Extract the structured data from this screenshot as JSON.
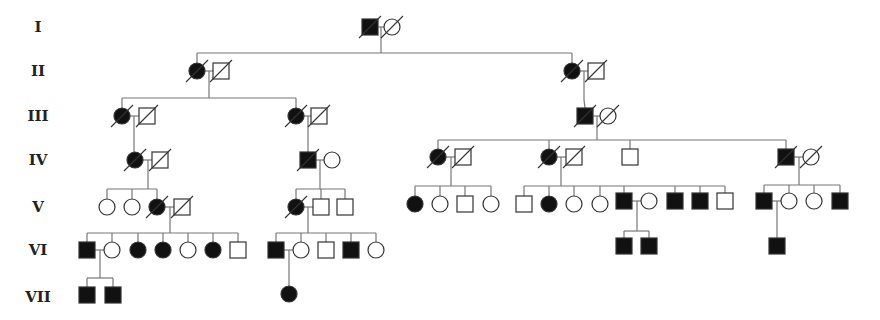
{
  "legend": {
    "affected_fill": "#111111",
    "unaffected_fill": "#ffffff",
    "line_color": "#777777"
  },
  "generations": [
    {
      "label": "I",
      "y": 27
    },
    {
      "label": "II",
      "y": 71
    },
    {
      "label": "III",
      "y": 116
    },
    {
      "label": "IV",
      "y": 160
    },
    {
      "label": "V",
      "y": 207
    },
    {
      "label": "VI",
      "y": 250
    },
    {
      "label": "VII",
      "y": 297
    }
  ],
  "individuals": [
    {
      "id": "I-1",
      "sex": "M",
      "x": 370,
      "y": 27,
      "affected": true,
      "deceased": true
    },
    {
      "id": "I-2",
      "sex": "F",
      "x": 392,
      "y": 27,
      "affected": false,
      "deceased": true
    },
    {
      "id": "II-1",
      "sex": "F",
      "x": 197,
      "y": 71,
      "affected": true,
      "deceased": true
    },
    {
      "id": "II-2",
      "sex": "M",
      "x": 221,
      "y": 71,
      "affected": false,
      "deceased": true
    },
    {
      "id": "II-3",
      "sex": "F",
      "x": 572,
      "y": 71,
      "affected": true,
      "deceased": true
    },
    {
      "id": "II-4",
      "sex": "M",
      "x": 596,
      "y": 71,
      "affected": false,
      "deceased": true
    },
    {
      "id": "III-1",
      "sex": "F",
      "x": 122,
      "y": 116,
      "affected": true,
      "deceased": true
    },
    {
      "id": "III-2",
      "sex": "M",
      "x": 147,
      "y": 116,
      "affected": false,
      "deceased": true
    },
    {
      "id": "III-3",
      "sex": "F",
      "x": 296,
      "y": 116,
      "affected": true,
      "deceased": true
    },
    {
      "id": "III-4",
      "sex": "M",
      "x": 319,
      "y": 116,
      "affected": false,
      "deceased": true
    },
    {
      "id": "III-5",
      "sex": "M",
      "x": 585,
      "y": 116,
      "affected": true,
      "deceased": true
    },
    {
      "id": "III-6",
      "sex": "F",
      "x": 608,
      "y": 116,
      "affected": false,
      "deceased": true
    },
    {
      "id": "IV-1",
      "sex": "F",
      "x": 135,
      "y": 160,
      "affected": true,
      "deceased": true
    },
    {
      "id": "IV-2",
      "sex": "M",
      "x": 160,
      "y": 160,
      "affected": false,
      "deceased": true
    },
    {
      "id": "IV-3",
      "sex": "M",
      "x": 308,
      "y": 160,
      "affected": true,
      "deceased": true
    },
    {
      "id": "IV-4",
      "sex": "F",
      "x": 332,
      "y": 160,
      "affected": false,
      "deceased": false
    },
    {
      "id": "IV-5",
      "sex": "F",
      "x": 438,
      "y": 157,
      "affected": true,
      "deceased": true
    },
    {
      "id": "IV-6",
      "sex": "M",
      "x": 463,
      "y": 157,
      "affected": false,
      "deceased": true
    },
    {
      "id": "IV-7",
      "sex": "F",
      "x": 549,
      "y": 157,
      "affected": true,
      "deceased": true
    },
    {
      "id": "IV-8",
      "sex": "M",
      "x": 574,
      "y": 157,
      "affected": false,
      "deceased": true
    },
    {
      "id": "IV-9",
      "sex": "M",
      "x": 630,
      "y": 157,
      "affected": false,
      "deceased": false
    },
    {
      "id": "IV-10",
      "sex": "M",
      "x": 786,
      "y": 157,
      "affected": true,
      "deceased": true
    },
    {
      "id": "IV-11",
      "sex": "F",
      "x": 811,
      "y": 157,
      "affected": false,
      "deceased": true
    },
    {
      "id": "V-1",
      "sex": "F",
      "x": 107,
      "y": 207,
      "affected": false,
      "deceased": false
    },
    {
      "id": "V-2",
      "sex": "F",
      "x": 132,
      "y": 207,
      "affected": false,
      "deceased": false
    },
    {
      "id": "V-3",
      "sex": "F",
      "x": 157,
      "y": 207,
      "affected": true,
      "deceased": true
    },
    {
      "id": "V-4",
      "sex": "M",
      "x": 182,
      "y": 207,
      "affected": false,
      "deceased": true
    },
    {
      "id": "V-5",
      "sex": "F",
      "x": 296,
      "y": 207,
      "affected": true,
      "deceased": true
    },
    {
      "id": "V-6",
      "sex": "M",
      "x": 321,
      "y": 207,
      "affected": false,
      "deceased": false
    },
    {
      "id": "V-7",
      "sex": "M",
      "x": 345,
      "y": 207,
      "affected": false,
      "deceased": false
    },
    {
      "id": "V-8",
      "sex": "F",
      "x": 415,
      "y": 204,
      "affected": true,
      "deceased": false
    },
    {
      "id": "V-9",
      "sex": "F",
      "x": 440,
      "y": 204,
      "affected": false,
      "deceased": false
    },
    {
      "id": "V-10",
      "sex": "M",
      "x": 465,
      "y": 204,
      "affected": false,
      "deceased": false
    },
    {
      "id": "V-11",
      "sex": "F",
      "x": 491,
      "y": 204,
      "affected": false,
      "deceased": false
    },
    {
      "id": "V-12",
      "sex": "M",
      "x": 524,
      "y": 204,
      "affected": false,
      "deceased": false
    },
    {
      "id": "V-13",
      "sex": "F",
      "x": 549,
      "y": 204,
      "affected": true,
      "deceased": false
    },
    {
      "id": "V-14",
      "sex": "F",
      "x": 574,
      "y": 204,
      "affected": false,
      "deceased": false
    },
    {
      "id": "V-15",
      "sex": "F",
      "x": 600,
      "y": 204,
      "affected": false,
      "deceased": false
    },
    {
      "id": "V-16",
      "sex": "M",
      "x": 624,
      "y": 201,
      "affected": true,
      "deceased": false
    },
    {
      "id": "V-17",
      "sex": "F",
      "x": 649,
      "y": 201,
      "affected": false,
      "deceased": false
    },
    {
      "id": "V-18",
      "sex": "M",
      "x": 675,
      "y": 201,
      "affected": true,
      "deceased": false
    },
    {
      "id": "V-19",
      "sex": "M",
      "x": 700,
      "y": 201,
      "affected": true,
      "deceased": false
    },
    {
      "id": "V-20",
      "sex": "M",
      "x": 725,
      "y": 201,
      "affected": false,
      "deceased": false
    },
    {
      "id": "V-21",
      "sex": "M",
      "x": 764,
      "y": 201,
      "affected": true,
      "deceased": false
    },
    {
      "id": "V-22",
      "sex": "F",
      "x": 789,
      "y": 201,
      "affected": false,
      "deceased": false
    },
    {
      "id": "V-23",
      "sex": "F",
      "x": 814,
      "y": 201,
      "affected": false,
      "deceased": false
    },
    {
      "id": "V-24",
      "sex": "M",
      "x": 840,
      "y": 201,
      "affected": true,
      "deceased": false
    },
    {
      "id": "VI-1",
      "sex": "M",
      "x": 87,
      "y": 250,
      "affected": true,
      "deceased": false
    },
    {
      "id": "VI-2",
      "sex": "F",
      "x": 112,
      "y": 250,
      "affected": false,
      "deceased": false
    },
    {
      "id": "VI-3",
      "sex": "F",
      "x": 138,
      "y": 250,
      "affected": true,
      "deceased": false
    },
    {
      "id": "VI-4",
      "sex": "F",
      "x": 163,
      "y": 250,
      "affected": true,
      "deceased": false
    },
    {
      "id": "VI-5",
      "sex": "F",
      "x": 188,
      "y": 250,
      "affected": false,
      "deceased": false
    },
    {
      "id": "VI-6",
      "sex": "F",
      "x": 213,
      "y": 250,
      "affected": true,
      "deceased": false
    },
    {
      "id": "VI-7",
      "sex": "M",
      "x": 238,
      "y": 250,
      "affected": false,
      "deceased": false
    },
    {
      "id": "VI-8",
      "sex": "M",
      "x": 276,
      "y": 250,
      "affected": true,
      "deceased": false
    },
    {
      "id": "VI-9",
      "sex": "F",
      "x": 301,
      "y": 250,
      "affected": false,
      "deceased": false
    },
    {
      "id": "VI-10",
      "sex": "M",
      "x": 326,
      "y": 250,
      "affected": false,
      "deceased": false
    },
    {
      "id": "VI-11",
      "sex": "M",
      "x": 351,
      "y": 250,
      "affected": true,
      "deceased": false
    },
    {
      "id": "VI-12",
      "sex": "F",
      "x": 376,
      "y": 250,
      "affected": false,
      "deceased": false
    },
    {
      "id": "VI-13",
      "sex": "M",
      "x": 624,
      "y": 246,
      "affected": true,
      "deceased": false
    },
    {
      "id": "VI-14",
      "sex": "M",
      "x": 649,
      "y": 246,
      "affected": true,
      "deceased": false
    },
    {
      "id": "VI-15",
      "sex": "M",
      "x": 777,
      "y": 246,
      "affected": true,
      "deceased": false
    },
    {
      "id": "VII-1",
      "sex": "M",
      "x": 87,
      "y": 295,
      "affected": true,
      "deceased": false
    },
    {
      "id": "VII-2",
      "sex": "M",
      "x": 113,
      "y": 295,
      "affected": true,
      "deceased": false
    },
    {
      "id": "VII-3",
      "sex": "F",
      "x": 289,
      "y": 294,
      "affected": true,
      "deceased": false
    }
  ],
  "lines": [
    [
      381,
      27,
      381,
      27
    ],
    [
      378,
      27,
      385,
      27
    ],
    [
      381,
      27,
      381,
      53
    ],
    [
      197,
      53,
      572,
      53
    ],
    [
      197,
      53,
      197,
      63
    ],
    [
      572,
      53,
      572,
      63
    ],
    [
      205,
      71,
      213,
      71
    ],
    [
      209,
      71,
      209,
      98
    ],
    [
      122,
      98,
      296,
      98
    ],
    [
      122,
      98,
      122,
      108
    ],
    [
      296,
      98,
      296,
      108
    ],
    [
      580,
      71,
      588,
      71
    ],
    [
      584,
      71,
      584,
      100
    ],
    [
      584,
      100,
      585,
      108
    ],
    [
      130,
      116,
      139,
      116
    ],
    [
      134,
      116,
      134,
      152
    ],
    [
      304,
      116,
      311,
      116
    ],
    [
      308,
      116,
      308,
      152
    ],
    [
      593,
      116,
      600,
      116
    ],
    [
      597,
      116,
      597,
      140
    ],
    [
      438,
      140,
      786,
      140
    ],
    [
      438,
      140,
      438,
      149
    ],
    [
      549,
      140,
      549,
      149
    ],
    [
      630,
      140,
      630,
      149
    ],
    [
      786,
      140,
      786,
      149
    ],
    [
      143,
      160,
      152,
      160
    ],
    [
      148,
      160,
      148,
      189
    ],
    [
      107,
      189,
      157,
      189
    ],
    [
      107,
      189,
      107,
      199
    ],
    [
      132,
      189,
      132,
      199
    ],
    [
      157,
      189,
      157,
      199
    ],
    [
      316,
      160,
      324,
      160
    ],
    [
      320,
      160,
      320,
      189
    ],
    [
      296,
      189,
      345,
      189
    ],
    [
      296,
      189,
      296,
      199
    ],
    [
      321,
      189,
      321,
      199
    ],
    [
      345,
      189,
      345,
      199
    ],
    [
      446,
      157,
      455,
      157
    ],
    [
      451,
      157,
      451,
      186
    ],
    [
      415,
      186,
      491,
      186
    ],
    [
      415,
      186,
      415,
      196
    ],
    [
      440,
      186,
      440,
      196
    ],
    [
      465,
      186,
      465,
      196
    ],
    [
      491,
      186,
      491,
      196
    ],
    [
      557,
      157,
      566,
      157
    ],
    [
      561,
      157,
      561,
      186
    ],
    [
      524,
      186,
      725,
      186
    ],
    [
      524,
      186,
      524,
      196
    ],
    [
      549,
      186,
      549,
      196
    ],
    [
      574,
      186,
      574,
      196
    ],
    [
      600,
      186,
      600,
      196
    ],
    [
      624,
      186,
      624,
      193
    ],
    [
      675,
      186,
      675,
      193
    ],
    [
      700,
      186,
      700,
      193
    ],
    [
      725,
      186,
      725,
      193
    ],
    [
      794,
      157,
      803,
      157
    ],
    [
      799,
      157,
      799,
      185
    ],
    [
      764,
      185,
      840,
      185
    ],
    [
      764,
      185,
      764,
      193
    ],
    [
      789,
      185,
      789,
      193
    ],
    [
      814,
      185,
      814,
      193
    ],
    [
      840,
      185,
      840,
      193
    ],
    [
      165,
      207,
      174,
      207
    ],
    [
      170,
      207,
      170,
      233
    ],
    [
      87,
      233,
      238,
      233
    ],
    [
      87,
      233,
      87,
      242
    ],
    [
      112,
      233,
      112,
      242
    ],
    [
      138,
      233,
      138,
      242
    ],
    [
      163,
      233,
      163,
      242
    ],
    [
      188,
      233,
      188,
      242
    ],
    [
      213,
      233,
      213,
      242
    ],
    [
      238,
      233,
      238,
      242
    ],
    [
      304,
      207,
      313,
      207
    ],
    [
      308,
      207,
      308,
      233
    ],
    [
      276,
      233,
      376,
      233
    ],
    [
      276,
      233,
      276,
      242
    ],
    [
      301,
      233,
      301,
      242
    ],
    [
      326,
      233,
      326,
      242
    ],
    [
      351,
      233,
      351,
      242
    ],
    [
      376,
      233,
      376,
      242
    ],
    [
      632,
      201,
      641,
      201
    ],
    [
      637,
      201,
      637,
      231
    ],
    [
      624,
      231,
      649,
      231
    ],
    [
      624,
      231,
      624,
      238
    ],
    [
      649,
      231,
      649,
      238
    ],
    [
      772,
      201,
      781,
      201
    ],
    [
      777,
      201,
      777,
      238
    ],
    [
      95,
      250,
      104,
      250
    ],
    [
      100,
      250,
      100,
      278
    ],
    [
      87,
      278,
      113,
      278
    ],
    [
      87,
      278,
      87,
      287
    ],
    [
      113,
      278,
      113,
      287
    ],
    [
      284,
      250,
      293,
      250
    ],
    [
      289,
      250,
      289,
      286
    ]
  ]
}
